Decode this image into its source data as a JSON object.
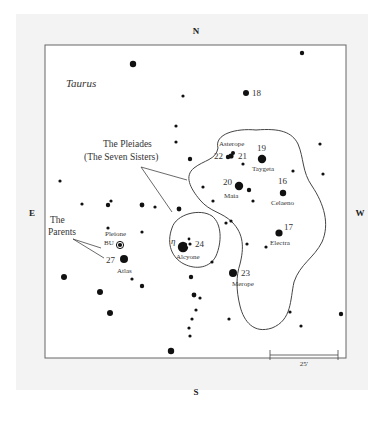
{
  "chart": {
    "title": "Taurus",
    "directions": {
      "north": "N",
      "south": "S",
      "east": "E",
      "west": "W"
    },
    "annotations": {
      "pleiades_line1": "The Pleiades",
      "pleiades_line2": "(The Seven Sisters)",
      "parents_line1": "The",
      "parents_line2": "Parents"
    },
    "scale_bar": {
      "label": "25'"
    },
    "named_stars": [
      {
        "name": "Asterope",
        "number": ""
      },
      {
        "name": "",
        "number": "22"
      },
      {
        "name": "",
        "number": "21"
      },
      {
        "name": "Taygeta",
        "number": "19"
      },
      {
        "name": "Maia",
        "number": "20"
      },
      {
        "name": "Celaeno",
        "number": "16"
      },
      {
        "name": "Electra",
        "number": "17"
      },
      {
        "name": "Alcyone",
        "number": "24",
        "greek": "η"
      },
      {
        "name": "Merope",
        "number": "23"
      },
      {
        "name": "Pleione",
        "number": "",
        "designation": "BU"
      },
      {
        "name": "Atlas",
        "number": "27"
      },
      {
        "name": "",
        "number": "18"
      }
    ],
    "colors": {
      "frame": "#666666",
      "star": "#111111",
      "plate": "#f3f3f3",
      "background": "#ffffff"
    }
  }
}
